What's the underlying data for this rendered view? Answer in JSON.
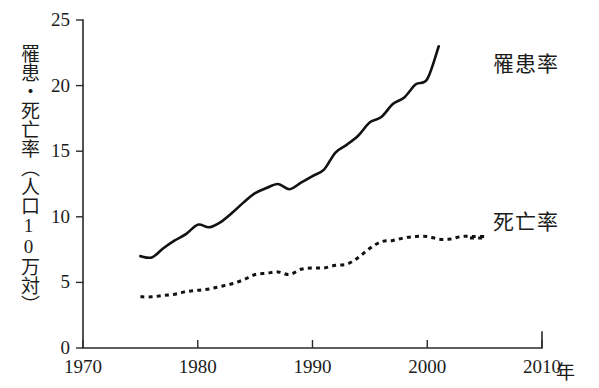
{
  "chart_data": {
    "type": "line",
    "title": "",
    "xlabel": "年",
    "ylabel": "罹患・死亡率（人口10万対）",
    "xlim": [
      1970,
      2010
    ],
    "ylim": [
      0,
      25
    ],
    "xticks": [
      1970,
      1980,
      1990,
      2000,
      2010
    ],
    "yticks": [
      0,
      5,
      10,
      15,
      20,
      25
    ],
    "grid": false,
    "legend_position": "right-inline",
    "series": [
      {
        "name": "罹患率",
        "style": "solid",
        "x": [
          1975,
          1976,
          1977,
          1978,
          1979,
          1980,
          1981,
          1982,
          1983,
          1984,
          1985,
          1986,
          1987,
          1988,
          1989,
          1990,
          1991,
          1992,
          1993,
          1994,
          1995,
          1996,
          1997,
          1998,
          1999,
          2000,
          2001
        ],
        "values": [
          7.0,
          6.9,
          7.6,
          8.2,
          8.7,
          9.4,
          9.2,
          9.6,
          10.3,
          11.1,
          11.8,
          12.2,
          12.5,
          12.1,
          12.6,
          13.1,
          13.6,
          14.9,
          15.5,
          16.2,
          17.2,
          17.6,
          18.6,
          19.1,
          20.1,
          20.5,
          23.0
        ]
      },
      {
        "name": "死亡率",
        "style": "dotted",
        "x": [
          1975,
          1976,
          1977,
          1978,
          1979,
          1980,
          1981,
          1982,
          1983,
          1984,
          1985,
          1986,
          1987,
          1988,
          1989,
          1990,
          1991,
          1992,
          1993,
          1994,
          1995,
          1996,
          1997,
          1998,
          1999,
          2000,
          2001,
          2002,
          2003,
          2004,
          2005
        ],
        "values": [
          3.9,
          3.9,
          4.0,
          4.1,
          4.3,
          4.4,
          4.5,
          4.7,
          4.9,
          5.2,
          5.6,
          5.7,
          5.8,
          5.6,
          6.0,
          6.1,
          6.1,
          6.3,
          6.4,
          6.9,
          7.6,
          8.1,
          8.2,
          8.4,
          8.5,
          8.5,
          8.3,
          8.3,
          8.5,
          8.5,
          8.5
        ]
      }
    ]
  },
  "axes": {
    "y_title": "罹患・死亡率（人口10万対）",
    "x_unit": "年",
    "y_tick_labels": [
      "25",
      "20",
      "15",
      "10",
      "5",
      "0"
    ],
    "x_tick_labels": [
      "1970",
      "1980",
      "1990",
      "2000",
      "2010"
    ]
  },
  "labels": {
    "incidence": "罹患率",
    "mortality": "死亡率"
  },
  "colors": {
    "axis": "#2b2b2b",
    "line": "#121212",
    "background": "#ffffff",
    "text": "#1c1c1c"
  }
}
